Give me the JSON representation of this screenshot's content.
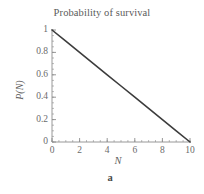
{
  "figure": {
    "panel_label": "a",
    "background_color": "#ffffff",
    "line_color": "#3c3c3c",
    "axis_color": "#8c8c8c",
    "text_color": "#5a5a5a"
  },
  "chart_data": {
    "type": "line",
    "title": "Probability of survival",
    "xlabel": "N",
    "ylabel": "P(N)",
    "xlim": [
      0,
      10
    ],
    "ylim": [
      0,
      1
    ],
    "grid": false,
    "legend": null,
    "x_ticks": [
      0,
      2,
      4,
      6,
      8,
      10
    ],
    "x_tick_labels": [
      "0",
      "2",
      "4",
      "6",
      "8",
      "10"
    ],
    "x_minor_tick_step": 0.5,
    "y_ticks": [
      0,
      0.2,
      0.4,
      0.6,
      0.8,
      1
    ],
    "y_tick_labels": [
      "0",
      "0.2",
      "0.4",
      "0.6",
      "0.8",
      "1"
    ],
    "y_minor_tick_step": 0.05,
    "series": [
      {
        "name": "P(N)",
        "x": [
          0,
          1,
          2,
          3,
          4,
          5,
          6,
          7,
          8,
          9,
          10
        ],
        "values": [
          1.0,
          0.9,
          0.8,
          0.7,
          0.6,
          0.5,
          0.4,
          0.3,
          0.2,
          0.1,
          0.0
        ]
      }
    ],
    "annotations": []
  }
}
